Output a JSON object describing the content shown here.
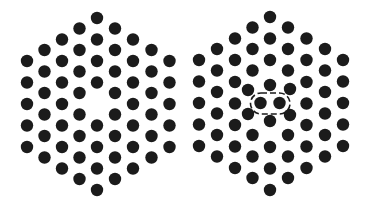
{
  "diagram": {
    "width": 368,
    "height": 215,
    "atom_color": "#1b1b1b",
    "background": "#ffffff",
    "atom_radius": 6.2,
    "panels": [
      {
        "name": "vacancy-lattice",
        "defect": "vacancy",
        "atoms": [
          [
            97,
            18
          ],
          [
            97,
            39.5
          ],
          [
            97,
            61
          ],
          [
            97,
            82.5
          ],
          [
            97,
            125.5
          ],
          [
            97,
            147
          ],
          [
            97,
            168.5
          ],
          [
            97,
            190
          ],
          [
            79.5,
            28.5
          ],
          [
            79.5,
            50
          ],
          [
            79.5,
            71.5
          ],
          [
            79.5,
            93
          ],
          [
            79.5,
            114.5
          ],
          [
            79.5,
            136
          ],
          [
            79.5,
            157.5
          ],
          [
            79.5,
            179
          ],
          [
            115,
            28.5
          ],
          [
            115,
            50
          ],
          [
            115,
            71.5
          ],
          [
            115,
            93
          ],
          [
            115,
            114.5
          ],
          [
            115,
            136
          ],
          [
            115,
            157.5
          ],
          [
            115,
            179
          ],
          [
            62,
            39.5
          ],
          [
            62,
            61
          ],
          [
            62,
            82.5
          ],
          [
            62,
            104
          ],
          [
            62,
            125.5
          ],
          [
            62,
            147
          ],
          [
            62,
            168.5
          ],
          [
            133,
            39.5
          ],
          [
            133,
            61
          ],
          [
            133,
            82.5
          ],
          [
            133,
            104
          ],
          [
            133,
            125.5
          ],
          [
            133,
            147
          ],
          [
            133,
            168.5
          ],
          [
            44.5,
            50
          ],
          [
            44.5,
            71.5
          ],
          [
            44.5,
            93
          ],
          [
            44.5,
            114.5
          ],
          [
            44.5,
            136
          ],
          [
            44.5,
            157.5
          ],
          [
            151.5,
            50
          ],
          [
            151.5,
            71.5
          ],
          [
            151.5,
            93
          ],
          [
            151.5,
            114.5
          ],
          [
            151.5,
            136
          ],
          [
            151.5,
            157.5
          ],
          [
            27,
            61
          ],
          [
            27,
            82.5
          ],
          [
            27,
            104
          ],
          [
            27,
            125.5
          ],
          [
            27,
            147
          ],
          [
            169.5,
            61
          ],
          [
            169.5,
            82.5
          ],
          [
            169.5,
            104
          ],
          [
            169.5,
            125.5
          ],
          [
            169.5,
            147
          ]
        ]
      },
      {
        "name": "split-interstitial-lattice",
        "defect": "split-interstitial",
        "atoms": [
          [
            270,
            17
          ],
          [
            270,
            38.5
          ],
          [
            270,
            60
          ],
          [
            270,
            85
          ],
          [
            270,
            121
          ],
          [
            270,
            147
          ],
          [
            270,
            168.5
          ],
          [
            270,
            190
          ],
          [
            252.5,
            27.5
          ],
          [
            252.5,
            49
          ],
          [
            252.5,
            70.5
          ],
          [
            248,
            90
          ],
          [
            248,
            114
          ],
          [
            252.5,
            135
          ],
          [
            252.5,
            156.5
          ],
          [
            252.5,
            178
          ],
          [
            288,
            27.5
          ],
          [
            288,
            49
          ],
          [
            288,
            70.5
          ],
          [
            290,
            89
          ],
          [
            290,
            115
          ],
          [
            288,
            135
          ],
          [
            288,
            156.5
          ],
          [
            288,
            178
          ],
          [
            235,
            38.5
          ],
          [
            235,
            60
          ],
          [
            235,
            82
          ],
          [
            235,
            103.5
          ],
          [
            235,
            125
          ],
          [
            235,
            146.5
          ],
          [
            235,
            168
          ],
          [
            306.5,
            38.5
          ],
          [
            306.5,
            60
          ],
          [
            306.5,
            82
          ],
          [
            306.5,
            103.5
          ],
          [
            306.5,
            125
          ],
          [
            306.5,
            146.5
          ],
          [
            306.5,
            168
          ],
          [
            217,
            49
          ],
          [
            217,
            70.5
          ],
          [
            217,
            92
          ],
          [
            217,
            113.5
          ],
          [
            217,
            135
          ],
          [
            217,
            156.5
          ],
          [
            325,
            49
          ],
          [
            325,
            70.5
          ],
          [
            325,
            92
          ],
          [
            325,
            113.5
          ],
          [
            325,
            135
          ],
          [
            325,
            156.5
          ],
          [
            199,
            60
          ],
          [
            199,
            81.5
          ],
          [
            199,
            103
          ],
          [
            199,
            124.5
          ],
          [
            199,
            146
          ],
          [
            343,
            60
          ],
          [
            343,
            81.5
          ],
          [
            343,
            103
          ],
          [
            343,
            124.5
          ],
          [
            343,
            146
          ]
        ],
        "interstitial_pair": [
          [
            260.5,
            103
          ],
          [
            279.5,
            103
          ]
        ],
        "capsule": {
          "x": 250.5,
          "y": 93,
          "width": 39.5,
          "height": 21,
          "rx": 10.5
        }
      }
    ]
  }
}
